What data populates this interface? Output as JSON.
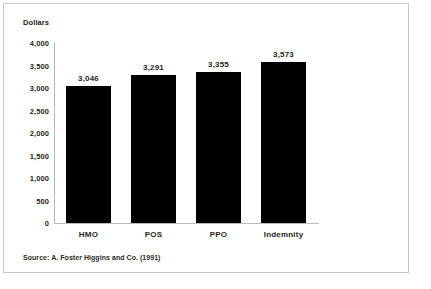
{
  "figure": {
    "axis_title": "Dollars",
    "source_note": "Source: A. Foster Higgins and Co. (1991)",
    "border_color": "#c9c9c9",
    "bar_color": "#000000",
    "axis_color": "#bcbcbc"
  },
  "chart_data": {
    "type": "bar",
    "title": "",
    "subtitle": "",
    "xlabel": "",
    "ylabel": "Dollars",
    "categories": [
      "HMO",
      "POS",
      "PPO",
      "Indemnity"
    ],
    "values": [
      3046,
      3291,
      3355,
      3573
    ],
    "value_labels": [
      "3,046",
      "3,291",
      "3,355",
      "3,573"
    ],
    "ylim": [
      0,
      4000
    ],
    "ytick_values": [
      4000,
      3500,
      3000,
      2500,
      2000,
      1500,
      1000,
      500,
      0
    ],
    "ytick_labels": [
      "4,000",
      "3,500",
      "3,000",
      "2,500",
      "2,000",
      "1,500",
      "1,000",
      "500",
      "0"
    ],
    "grid": false,
    "legend": null,
    "annotations": [
      "Source: A. Foster Higgins and Co. (1991)"
    ]
  }
}
